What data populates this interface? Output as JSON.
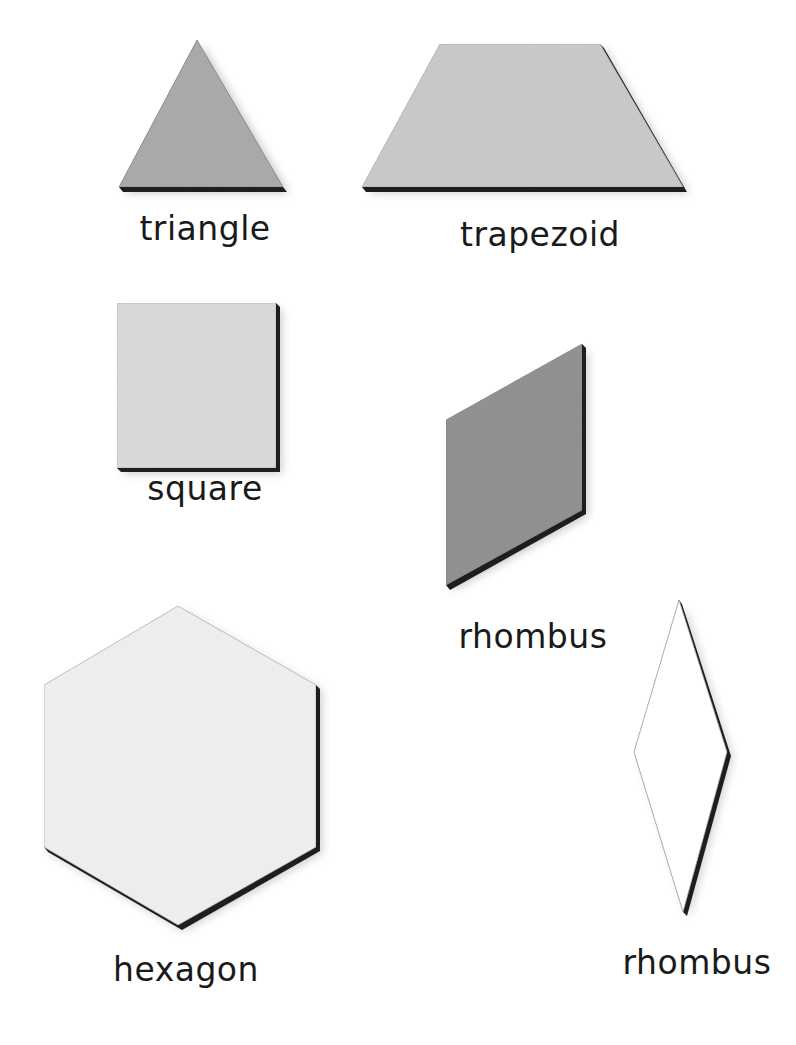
{
  "figure": {
    "shapes": [
      {
        "id": "triangle",
        "label": "triangle",
        "fill": "#a9a9a9",
        "points": [
          [
            197,
            40
          ],
          [
            283,
            187
          ],
          [
            119,
            187
          ]
        ],
        "label_pos": [
          205,
          210
        ]
      },
      {
        "id": "trapezoid",
        "label": "trapezoid",
        "fill": "#c9c9c9",
        "points": [
          [
            440,
            44
          ],
          [
            600,
            44
          ],
          [
            683,
            187
          ],
          [
            362,
            187
          ]
        ],
        "label_pos": [
          540,
          218
        ]
      },
      {
        "id": "square",
        "label": "square",
        "fill": "#dadada",
        "points": [
          [
            117,
            303
          ],
          [
            276,
            303
          ],
          [
            276,
            468
          ],
          [
            117,
            468
          ]
        ],
        "label_pos": [
          205,
          472
        ]
      },
      {
        "id": "rhombus-dark",
        "label": "rhombus",
        "fill": "#8f8f8f",
        "points": [
          [
            446,
            420
          ],
          [
            582,
            344
          ],
          [
            582,
            510
          ],
          [
            446,
            585
          ]
        ],
        "label_pos": [
          533,
          620
        ]
      },
      {
        "id": "hexagon",
        "label": "hexagon",
        "fill": "#efefef",
        "points": [
          [
            178,
            606
          ],
          [
            316,
            685
          ],
          [
            316,
            847
          ],
          [
            178,
            925
          ],
          [
            44,
            847
          ],
          [
            44,
            685
          ]
        ],
        "label_pos": [
          186,
          953
        ]
      },
      {
        "id": "rhombus-thin",
        "label": "rhombus",
        "fill": "#ffffff",
        "points": [
          [
            679,
            600
          ],
          [
            727,
            752
          ],
          [
            683,
            912
          ],
          [
            634,
            752
          ]
        ],
        "label_pos": [
          697,
          945
        ]
      }
    ],
    "shadow_color": "#1e1e1e"
  },
  "labels": {
    "triangle": "triangle",
    "trapezoid": "trapezoid",
    "square": "square",
    "rhombus_1": "rhombus",
    "hexagon": "hexagon",
    "rhombus_2": "rhombus"
  }
}
